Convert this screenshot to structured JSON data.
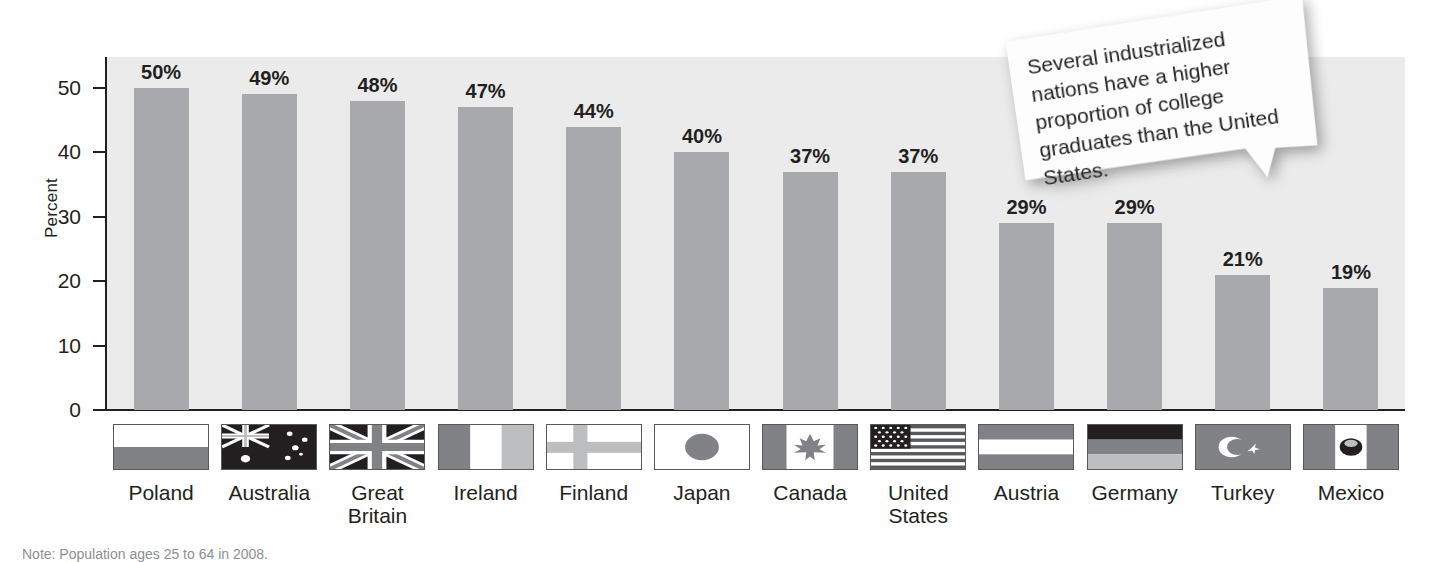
{
  "chart_data": {
    "type": "bar",
    "title": "",
    "xlabel": "",
    "ylabel": "Percent",
    "ylim": [
      0,
      54.8
    ],
    "yticks": [
      0,
      10,
      20,
      30,
      40,
      50
    ],
    "grid": false,
    "legend": "none",
    "bar_color": "#a7a9ac",
    "plot_background": "#ebebeb",
    "categories": [
      "Poland",
      "Australia",
      "Great Britain",
      "Ireland",
      "Finland",
      "Japan",
      "Canada",
      "United States",
      "Austria",
      "Germany",
      "Turkey",
      "Mexico"
    ],
    "category_lines": [
      [
        "Poland"
      ],
      [
        "Australia"
      ],
      [
        "Great",
        "Britain"
      ],
      [
        "Ireland"
      ],
      [
        "Finland"
      ],
      [
        "Japan"
      ],
      [
        "Canada"
      ],
      [
        "United",
        "States"
      ],
      [
        "Austria"
      ],
      [
        "Germany"
      ],
      [
        "Turkey"
      ],
      [
        "Mexico"
      ]
    ],
    "values": [
      50,
      49,
      48,
      47,
      44,
      40,
      37,
      37,
      29,
      29,
      21,
      19
    ],
    "data_labels": [
      "50%",
      "49%",
      "48%",
      "47%",
      "44%",
      "40%",
      "37%",
      "37%",
      "29%",
      "29%",
      "21%",
      "19%"
    ],
    "flags": [
      "flag-poland-icon",
      "flag-australia-icon",
      "flag-great-britain-icon",
      "flag-ireland-icon",
      "flag-finland-icon",
      "flag-japan-icon",
      "flag-canada-icon",
      "flag-united-states-icon",
      "flag-austria-icon",
      "flag-germany-icon",
      "flag-turkey-icon",
      "flag-mexico-icon"
    ]
  },
  "annotation": {
    "callout_text": "Several industrialized nations have a higher proportion of college graduates than the United States."
  },
  "footnote": {
    "text": "Note: Population ages 25 to 64 in 2008."
  }
}
